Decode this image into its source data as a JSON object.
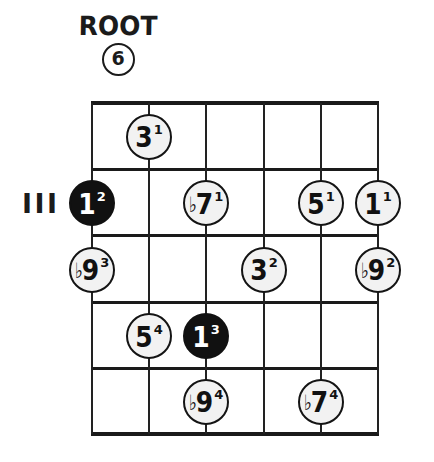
{
  "title": {
    "heading": "ROOT",
    "circled_number": "6"
  },
  "fret_marker": {
    "label": "III"
  },
  "diagram": {
    "type": "guitar-fretboard",
    "strings": 6,
    "frets": 5,
    "string_x": [
      92,
      149,
      206,
      264,
      321,
      378
    ],
    "fret_y": [
      103,
      170,
      236,
      303,
      369,
      434
    ],
    "colors": {
      "ink": "#111111",
      "open_fill": "#f2f2f2",
      "root_fill": "#111111",
      "background": "#ffffff"
    }
  },
  "notes": [
    {
      "name": "note-3-1",
      "degree": "3",
      "flat": "",
      "finger": "1",
      "string": 2,
      "fret": 1,
      "root": false
    },
    {
      "name": "note-1-2",
      "degree": "1",
      "flat": "",
      "finger": "2",
      "string": 1,
      "fret": 2,
      "root": true
    },
    {
      "name": "note-b7-1",
      "degree": "7",
      "flat": "♭",
      "finger": "1",
      "string": 3,
      "fret": 2,
      "root": false
    },
    {
      "name": "note-5-1",
      "degree": "5",
      "flat": "",
      "finger": "1",
      "string": 5,
      "fret": 2,
      "root": false
    },
    {
      "name": "note-1-1",
      "degree": "1",
      "flat": "",
      "finger": "1",
      "string": 6,
      "fret": 2,
      "root": false
    },
    {
      "name": "note-b9-3",
      "degree": "9",
      "flat": "♭",
      "finger": "3",
      "string": 1,
      "fret": 3,
      "root": false
    },
    {
      "name": "note-3-2",
      "degree": "3",
      "flat": "",
      "finger": "2",
      "string": 4,
      "fret": 3,
      "root": false
    },
    {
      "name": "note-b9-2",
      "degree": "9",
      "flat": "♭",
      "finger": "2",
      "string": 6,
      "fret": 3,
      "root": false
    },
    {
      "name": "note-5-4",
      "degree": "5",
      "flat": "",
      "finger": "4",
      "string": 2,
      "fret": 4,
      "root": false
    },
    {
      "name": "note-1-3",
      "degree": "1",
      "flat": "",
      "finger": "3",
      "string": 3,
      "fret": 4,
      "root": true
    },
    {
      "name": "note-b9-4",
      "degree": "9",
      "flat": "♭",
      "finger": "4",
      "string": 3,
      "fret": 5,
      "root": false
    },
    {
      "name": "note-b7-4",
      "degree": "7",
      "flat": "♭",
      "finger": "4",
      "string": 5,
      "fret": 5,
      "root": false
    }
  ]
}
